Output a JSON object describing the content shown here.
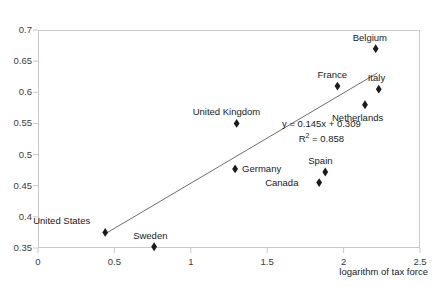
{
  "chart_data": {
    "type": "scatter",
    "title": "",
    "xlabel": "logarithm of tax force",
    "ylabel": "",
    "xlim": [
      0,
      2.5
    ],
    "ylim": [
      0.35,
      0.7
    ],
    "xticks": [
      "0",
      "0.5",
      "1",
      "1.5",
      "2",
      "2.5"
    ],
    "xtick_values": [
      0,
      0.5,
      1,
      1.5,
      2,
      2.5
    ],
    "yticks": [
      "0.35",
      "0.4",
      "0.45",
      "0.5",
      "0.55",
      "0.6",
      "0.65",
      "0.7"
    ],
    "ytick_values": [
      0.35,
      0.4,
      0.45,
      0.5,
      0.55,
      0.6,
      0.65,
      0.7
    ],
    "grid": false,
    "legend": "none",
    "points": [
      {
        "label": "United States",
        "x": 0.44,
        "y": 0.375,
        "label_dx": -72,
        "label_dy": -17
      },
      {
        "label": "Sweden",
        "x": 0.76,
        "y": 0.352,
        "label_dx": -21,
        "label_dy": -17
      },
      {
        "label": "Canada",
        "x": 1.84,
        "y": 0.455,
        "label_dx": -54,
        "label_dy": -6
      },
      {
        "label": "Spain",
        "x": 1.88,
        "y": 0.472,
        "label_dx": -17,
        "label_dy": -17
      },
      {
        "label": "Germany",
        "x": 1.29,
        "y": 0.477,
        "label_dx": 7,
        "label_dy": -6
      },
      {
        "label": "United Kingdom",
        "x": 1.3,
        "y": 0.55,
        "label_dx": -44,
        "label_dy": -17
      },
      {
        "label": "France",
        "x": 1.96,
        "y": 0.61,
        "label_dx": -20,
        "label_dy": -17
      },
      {
        "label": "Netherlands",
        "x": 2.14,
        "y": 0.58,
        "label_dx": -33,
        "label_dy": 7
      },
      {
        "label": "Italy",
        "x": 2.23,
        "y": 0.605,
        "label_dx": -11,
        "label_dy": -17
      },
      {
        "label": "Belgium",
        "x": 2.21,
        "y": 0.67,
        "label_dx": -23,
        "label_dy": -17
      }
    ],
    "trendline": {
      "slope": 0.145,
      "intercept": 0.309,
      "r_squared": 0.858,
      "x_start": 0.44,
      "x_end": 2.22,
      "equation_text": "y = 0.145x + 0.309",
      "r2_text_prefix": "R",
      "r2_text_suffix": " = 0.858"
    },
    "colors": {
      "marker": "#1a1a1a",
      "line": "#6e6e6e",
      "frame": "#c9c9c9",
      "text": "#1a1a1a",
      "tick_text": "#3b3b3b",
      "background": "#ffffff"
    }
  }
}
